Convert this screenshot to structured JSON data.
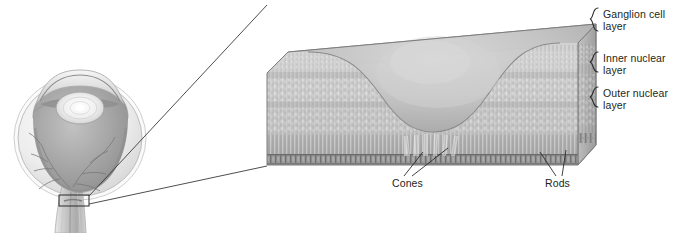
{
  "figure": {
    "background_color": "#ffffff",
    "text_color": "#231f20",
    "line_color": "#3a3a3a"
  },
  "eye": {
    "name": "eye-cross-section",
    "parts": [
      "sclera",
      "cornea",
      "lens",
      "anterior-chamber",
      "vitreous-chamber",
      "retina",
      "retinal-vessels",
      "optic-nerve",
      "fovea-callout-box"
    ],
    "palette": {
      "sclera_outer": "#f2f2f2",
      "sclera_shade": "#d8d8d8",
      "vitreous": "#9a9a9a",
      "vitreous_light": "#b8b8b8",
      "lens": "#f4f4f4",
      "vessel": "#7c7c7c",
      "outline": "#8a8a8a"
    }
  },
  "callout": {
    "name": "magnification-callout",
    "box_label": "fovea region"
  },
  "block": {
    "name": "retina-3d-block",
    "palette": {
      "top_face": "#dcdcdc",
      "top_face_light": "#ececec",
      "front_face": "#c9c9c9",
      "right_face": "#b4b4b4",
      "pit": "#bcbcbc",
      "basal_band": "#8f8f8f",
      "edge": "#7a7a7a"
    },
    "feature": "fovea pit"
  },
  "labels": {
    "layers": [
      {
        "id": "ganglion",
        "line1": "Ganglion cell",
        "line2": "layer"
      },
      {
        "id": "inner",
        "line1": "Inner nuclear",
        "line2": "layer"
      },
      {
        "id": "outer",
        "line1": "Outer nuclear",
        "line2": "layer"
      }
    ],
    "cones": "Cones",
    "rods": "Rods"
  }
}
